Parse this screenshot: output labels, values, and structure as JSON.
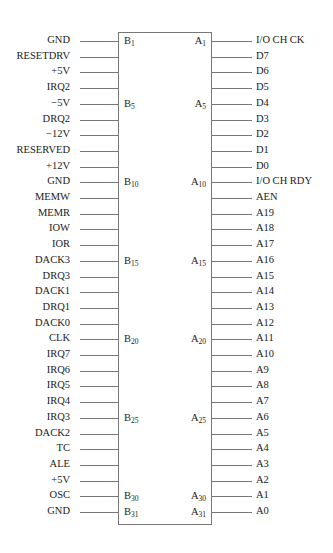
{
  "diagram": {
    "type": "connector-pinout",
    "b_side": [
      {
        "signal": "GND",
        "pin": "B",
        "num": "1"
      },
      {
        "signal": "RESETDRV",
        "pin": "",
        "num": ""
      },
      {
        "signal": "+5V",
        "pin": "",
        "num": ""
      },
      {
        "signal": "IRQ2",
        "pin": "",
        "num": ""
      },
      {
        "signal": "−5V",
        "pin": "B",
        "num": "5"
      },
      {
        "signal": "DRQ2",
        "pin": "",
        "num": ""
      },
      {
        "signal": "−12V",
        "pin": "",
        "num": ""
      },
      {
        "signal": "RESERVED",
        "pin": "",
        "num": ""
      },
      {
        "signal": "+12V",
        "pin": "",
        "num": ""
      },
      {
        "signal": "GND",
        "pin": "B",
        "num": "10"
      },
      {
        "signal": "MEMW",
        "pin": "",
        "num": ""
      },
      {
        "signal": "MEMR",
        "pin": "",
        "num": ""
      },
      {
        "signal": "IOW",
        "pin": "",
        "num": ""
      },
      {
        "signal": "IOR",
        "pin": "",
        "num": ""
      },
      {
        "signal": "DACK3",
        "pin": "B",
        "num": "15"
      },
      {
        "signal": "DRQ3",
        "pin": "",
        "num": ""
      },
      {
        "signal": "DACK1",
        "pin": "",
        "num": ""
      },
      {
        "signal": "DRQ1",
        "pin": "",
        "num": ""
      },
      {
        "signal": "DACK0",
        "pin": "",
        "num": ""
      },
      {
        "signal": "CLK",
        "pin": "B",
        "num": "20"
      },
      {
        "signal": "IRQ7",
        "pin": "",
        "num": ""
      },
      {
        "signal": "IRQ6",
        "pin": "",
        "num": ""
      },
      {
        "signal": "IRQ5",
        "pin": "",
        "num": ""
      },
      {
        "signal": "IRQ4",
        "pin": "",
        "num": ""
      },
      {
        "signal": "IRQ3",
        "pin": "B",
        "num": "25"
      },
      {
        "signal": "DACK2",
        "pin": "",
        "num": ""
      },
      {
        "signal": "TC",
        "pin": "",
        "num": ""
      },
      {
        "signal": "ALE",
        "pin": "",
        "num": ""
      },
      {
        "signal": "+5V",
        "pin": "",
        "num": ""
      },
      {
        "signal": "OSC",
        "pin": "B",
        "num": "30"
      },
      {
        "signal": "GND",
        "pin": "B",
        "num": "31"
      }
    ],
    "a_side": [
      {
        "signal": "I/O CH CK",
        "pin": "A",
        "num": "1"
      },
      {
        "signal": "D7",
        "pin": "",
        "num": ""
      },
      {
        "signal": "D6",
        "pin": "",
        "num": ""
      },
      {
        "signal": "D5",
        "pin": "",
        "num": ""
      },
      {
        "signal": "D4",
        "pin": "A",
        "num": "5"
      },
      {
        "signal": "D3",
        "pin": "",
        "num": ""
      },
      {
        "signal": "D2",
        "pin": "",
        "num": ""
      },
      {
        "signal": "D1",
        "pin": "",
        "num": ""
      },
      {
        "signal": "D0",
        "pin": "",
        "num": ""
      },
      {
        "signal": "I/O CH RDY",
        "pin": "A",
        "num": "10"
      },
      {
        "signal": "AEN",
        "pin": "",
        "num": ""
      },
      {
        "signal": "A19",
        "pin": "",
        "num": ""
      },
      {
        "signal": "A18",
        "pin": "",
        "num": ""
      },
      {
        "signal": "A17",
        "pin": "",
        "num": ""
      },
      {
        "signal": "A16",
        "pin": "A",
        "num": "15"
      },
      {
        "signal": "A15",
        "pin": "",
        "num": ""
      },
      {
        "signal": "A14",
        "pin": "",
        "num": ""
      },
      {
        "signal": "A13",
        "pin": "",
        "num": ""
      },
      {
        "signal": "A12",
        "pin": "",
        "num": ""
      },
      {
        "signal": "A11",
        "pin": "A",
        "num": "20"
      },
      {
        "signal": "A10",
        "pin": "",
        "num": ""
      },
      {
        "signal": "A9",
        "pin": "",
        "num": ""
      },
      {
        "signal": "A8",
        "pin": "",
        "num": ""
      },
      {
        "signal": "A7",
        "pin": "",
        "num": ""
      },
      {
        "signal": "A6",
        "pin": "A",
        "num": "25"
      },
      {
        "signal": "A5",
        "pin": "",
        "num": ""
      },
      {
        "signal": "A4",
        "pin": "",
        "num": ""
      },
      {
        "signal": "A3",
        "pin": "",
        "num": ""
      },
      {
        "signal": "A2",
        "pin": "",
        "num": ""
      },
      {
        "signal": "A1",
        "pin": "A",
        "num": "30"
      },
      {
        "signal": "A0",
        "pin": "A",
        "num": "31"
      }
    ]
  },
  "layout": {
    "row_top_start": 33,
    "row_spacing": 15.7
  }
}
